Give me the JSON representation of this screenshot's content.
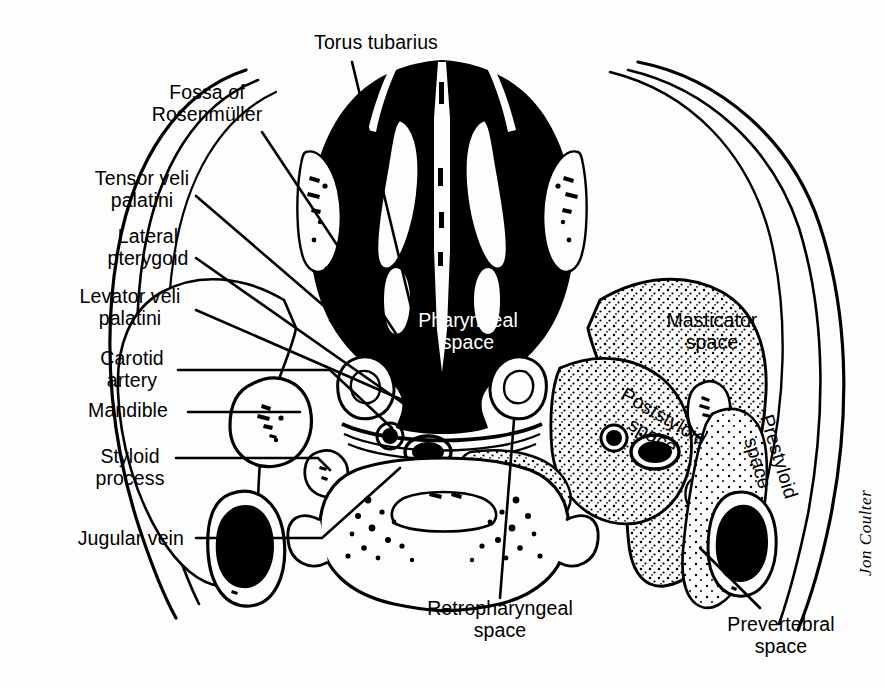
{
  "figure": {
    "background_color": "#fdfdfd",
    "ink_color": "#000000",
    "signature": "Jon Coulter"
  },
  "labels": {
    "torus_tubarius": "Torus tubarius",
    "fossa_of_rosenmuller": "Fossa of\nRosenmüller",
    "tensor_veli_palatini": "Tensor veli\npalatini",
    "lateral_pterygoid": "Lateral\npterygoid",
    "levator_veli_palatini": "Levator veli\npalatini",
    "carotid_artery": "Carotid\nartery",
    "mandible": "Mandible",
    "styloid_process": "Styloid\nprocess",
    "jugular_vein": "Jugular vein",
    "pharyngeal_space": "Pharyngeal\nspace",
    "masticator_space": "Masticator\nspace",
    "poststyloid_space": "Poststyloid\nspace",
    "prestyloid_space": "Prestyloid\nspace",
    "retropharyngeal_space": "Retropharyngeal\nspace",
    "prevertebral_space": "Prevertebral\nspace"
  }
}
